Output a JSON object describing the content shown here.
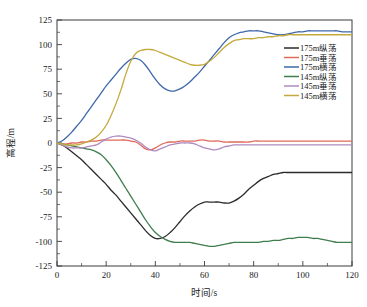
{
  "chart_data": {
    "type": "line",
    "title": "",
    "xlabel": "时间/s",
    "ylabel": "高程/m",
    "xlim": [
      0,
      120
    ],
    "ylim": [
      -125,
      125
    ],
    "xticks": [
      0,
      20,
      40,
      60,
      80,
      100,
      120
    ],
    "yticks": [
      -125,
      -100,
      -75,
      -50,
      -25,
      0,
      25,
      50,
      75,
      100,
      125
    ],
    "xtick_labels": [
      "0",
      "20",
      "40",
      "60",
      "80",
      "100",
      "120"
    ],
    "ytick_labels": [
      "-125",
      "-100",
      "-75",
      "-50",
      "-25",
      "0",
      "25",
      "50",
      "75",
      "100",
      "125"
    ],
    "grid": false,
    "legend_position": "right",
    "x": [
      0,
      2,
      4,
      6,
      8,
      10,
      12,
      14,
      16,
      18,
      20,
      22,
      24,
      26,
      28,
      30,
      32,
      34,
      36,
      38,
      40,
      42,
      44,
      46,
      48,
      50,
      52,
      54,
      56,
      58,
      60,
      62,
      64,
      66,
      68,
      70,
      72,
      74,
      76,
      78,
      80,
      82,
      84,
      86,
      88,
      90,
      92,
      94,
      96,
      98,
      100,
      102,
      104,
      106,
      108,
      110,
      112,
      114,
      116,
      118,
      120
    ],
    "series": [
      {
        "name": "175m纵荡",
        "color": "#2b2b2b",
        "values": [
          0,
          -2,
          -5,
          -9,
          -13,
          -17,
          -22,
          -27,
          -32,
          -37,
          -42,
          -48,
          -53,
          -59,
          -65,
          -71,
          -77,
          -83,
          -89,
          -94,
          -97,
          -97,
          -95,
          -91,
          -86,
          -80,
          -74,
          -69,
          -65,
          -62,
          -60,
          -60,
          -60,
          -60,
          -61,
          -61,
          -59,
          -56,
          -52,
          -47,
          -43,
          -39,
          -36,
          -34,
          -32,
          -31,
          -30,
          -30,
          -30,
          -30,
          -30,
          -30,
          -30,
          -30,
          -30,
          -30,
          -30,
          -30,
          -30,
          -30,
          -30
        ]
      },
      {
        "name": "175m垂荡",
        "color": "#e06a5a",
        "values": [
          0,
          -1,
          -1,
          0,
          0,
          1,
          1,
          2,
          2,
          3,
          3,
          3,
          3,
          3,
          3,
          2,
          1,
          -2,
          -6,
          -7,
          -5,
          -2,
          0,
          1,
          1,
          2,
          2,
          2,
          2,
          3,
          3,
          2,
          2,
          2,
          1,
          1,
          1,
          1,
          1,
          1,
          2,
          2,
          2,
          2,
          2,
          2,
          2,
          2,
          2,
          2,
          2,
          2,
          2,
          2,
          2,
          2,
          2,
          2,
          2,
          2,
          2
        ]
      },
      {
        "name": "175m横荡",
        "color": "#3e68ab",
        "values": [
          0,
          2,
          6,
          11,
          17,
          23,
          30,
          37,
          44,
          51,
          58,
          64,
          70,
          76,
          81,
          85,
          86,
          84,
          79,
          72,
          65,
          59,
          55,
          53,
          53,
          55,
          58,
          62,
          67,
          72,
          78,
          84,
          90,
          96,
          102,
          107,
          110,
          112,
          113,
          114,
          114,
          114,
          113,
          112,
          111,
          110,
          110,
          111,
          112,
          113,
          113,
          114,
          114,
          114,
          114,
          114,
          114,
          114,
          113,
          113,
          113
        ]
      },
      {
        "name": "145m纵荡",
        "color": "#3f7d4e",
        "values": [
          0,
          -1,
          -2,
          -3,
          -4,
          -5,
          -6,
          -7,
          -9,
          -12,
          -17,
          -23,
          -30,
          -38,
          -46,
          -54,
          -62,
          -70,
          -78,
          -85,
          -91,
          -95,
          -98,
          -100,
          -101,
          -101,
          -101,
          -101,
          -102,
          -103,
          -104,
          -105,
          -105,
          -104,
          -103,
          -102,
          -101,
          -101,
          -101,
          -101,
          -101,
          -101,
          -100,
          -100,
          -99,
          -99,
          -98,
          -97,
          -97,
          -96,
          -96,
          -96,
          -97,
          -97,
          -98,
          -99,
          -100,
          -101,
          -101,
          -101,
          -101
        ]
      },
      {
        "name": "145m垂荡",
        "color": "#b08bc0",
        "values": [
          0,
          -2,
          -4,
          -5,
          -5,
          -5,
          -4,
          -3,
          -2,
          1,
          4,
          6,
          7,
          7,
          6,
          5,
          3,
          0,
          -4,
          -7,
          -8,
          -6,
          -4,
          -2,
          -1,
          0,
          0,
          0,
          -1,
          -3,
          -5,
          -6,
          -7,
          -6,
          -4,
          -3,
          -2,
          -2,
          -2,
          -2,
          -2,
          -2,
          -2,
          -2,
          -2,
          -2,
          -2,
          -2,
          -2,
          -2,
          -2,
          -2,
          -2,
          -2,
          -2,
          -2,
          -2,
          -2,
          -2,
          -2,
          -2
        ]
      },
      {
        "name": "145m横荡",
        "color": "#c4a93c",
        "values": [
          0,
          -1,
          -2,
          -2,
          -2,
          -1,
          1,
          3,
          6,
          11,
          18,
          28,
          40,
          54,
          70,
          83,
          91,
          94,
          95,
          95,
          94,
          92,
          90,
          88,
          86,
          84,
          82,
          80,
          79,
          79,
          80,
          83,
          87,
          92,
          97,
          101,
          104,
          105,
          106,
          106,
          106,
          107,
          107,
          108,
          108,
          109,
          109,
          110,
          110,
          110,
          110,
          110,
          110,
          110,
          110,
          110,
          110,
          110,
          110,
          110,
          110
        ]
      }
    ]
  },
  "legend": {
    "entries": [
      {
        "label": "175m纵荡",
        "color": "#2b2b2b"
      },
      {
        "label": "175m垂荡",
        "color": "#e06a5a"
      },
      {
        "label": "175m横荡",
        "color": "#3e68ab"
      },
      {
        "label": "145m纵荡",
        "color": "#3f7d4e"
      },
      {
        "label": "145m垂荡",
        "color": "#b08bc0"
      },
      {
        "label": "145m横荡",
        "color": "#c4a93c"
      }
    ]
  },
  "axes": {
    "x_title": "时间/s",
    "y_title": "高程/m"
  }
}
